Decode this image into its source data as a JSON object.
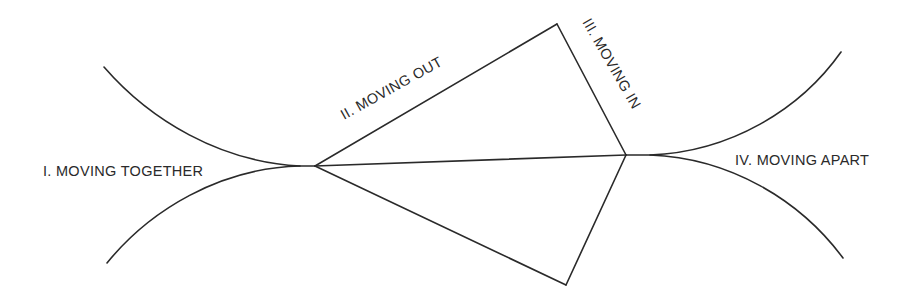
{
  "diagram": {
    "type": "phase-diagram",
    "colors": {
      "line": "#2a2a2a",
      "background": "#ffffff",
      "text": "#2a2a2a"
    },
    "labels": {
      "phase1": "I. MOVING TOGETHER",
      "phase2": "II. MOVING OUT",
      "phase3": "III. MOVING IN",
      "phase4": "IV. MOVING APART"
    },
    "nodes": {
      "left_vertex": [
        315,
        166
      ],
      "right_vertex": [
        626,
        155
      ],
      "top_vertex": [
        557,
        24
      ],
      "bottom_vertex": [
        566,
        285
      ]
    },
    "edges": [
      {
        "from": "left_vertex",
        "to": "top_vertex",
        "label": "II. MOVING OUT"
      },
      {
        "from": "top_vertex",
        "to": "right_vertex",
        "label": "III. MOVING IN"
      },
      {
        "from": "left_vertex",
        "to": "right_vertex"
      },
      {
        "from": "left_vertex",
        "to": "bottom_vertex"
      },
      {
        "from": "bottom_vertex",
        "to": "right_vertex"
      }
    ],
    "curves": [
      {
        "name": "converging-top-curve",
        "from": [
          104,
          67
        ],
        "to": [
          300,
          166
        ]
      },
      {
        "name": "converging-bottom-curve",
        "from": [
          107,
          263
        ],
        "to": [
          300,
          166
        ]
      },
      {
        "name": "diverging-top-curve",
        "from": [
          640,
          155
        ],
        "to": [
          841,
          52
        ]
      },
      {
        "name": "diverging-bottom-curve",
        "from": [
          640,
          155
        ],
        "to": [
          843,
          258
        ]
      }
    ]
  }
}
